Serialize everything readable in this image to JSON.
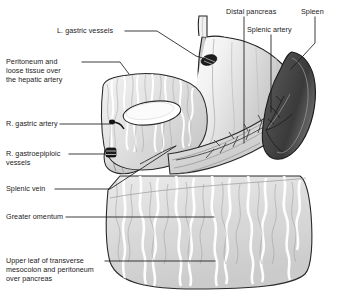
{
  "figure": {
    "background_color": "#ffffff",
    "line_color": "#1a1a1a",
    "tissue_fill": "#d9d9d9",
    "spleen_fill": "#4a4a4a",
    "vessel_fill": "#222222"
  },
  "labels": [
    {
      "id": "l-gastric-vessels",
      "name": "L. gastric vessels",
      "text": "L. gastric vessels",
      "x": 57,
      "y": 28,
      "align": "left"
    },
    {
      "id": "peritoneum-hepatic-artery",
      "name": "Peritoneum and loose tissue over the hepatic artery",
      "text": "Peritoneum and\nloose tissue over\nthe hepatic artery",
      "x": 6,
      "y": 59,
      "align": "left"
    },
    {
      "id": "r-gastric-artery",
      "name": "R. gastric artery",
      "text": "R. gastric artery",
      "x": 6,
      "y": 121,
      "align": "left"
    },
    {
      "id": "r-gastroepiploic-vessels",
      "name": "R. gastroepiploic vessels",
      "text": "R. gastroepiploic\nvessels",
      "x": 6,
      "y": 151,
      "align": "left"
    },
    {
      "id": "splenic-vein",
      "name": "Splenic vein",
      "text": "Splenic vein",
      "x": 6,
      "y": 186,
      "align": "left"
    },
    {
      "id": "greater-omentum",
      "name": "Greater omentum",
      "text": "Greater omentum",
      "x": 6,
      "y": 214,
      "align": "left"
    },
    {
      "id": "upper-leaf-transverse-mesocolon",
      "name": "Upper leaf of transverse mesocolon and peritoneum over pancreas",
      "text": "Upper leaf of transverse\nmesocolon and peritoneum\nover pancreas",
      "x": 6,
      "y": 258,
      "align": "left"
    },
    {
      "id": "distal-pancreas",
      "name": "Distal pancreas",
      "text": "Distal pancreas",
      "x": 226,
      "y": 9,
      "align": "left"
    },
    {
      "id": "spleen",
      "name": "Spleen",
      "text": "Spleen",
      "x": 301,
      "y": 9,
      "align": "left"
    },
    {
      "id": "splenic-artery",
      "name": "Splenic artery",
      "text": "Splenic artery",
      "x": 247,
      "y": 27,
      "align": "left"
    }
  ],
  "leader_lines": [
    {
      "id": "leader-l-gastric-vessels",
      "points": "125,31 157,31 196,56 206,59"
    },
    {
      "id": "leader-peritoneum",
      "points": "82,62 120,62 128,73"
    },
    {
      "id": "leader-r-gastric-artery",
      "points": "60,124 113,124"
    },
    {
      "id": "leader-r-gastroepiploic",
      "points": "69,154 110,154"
    },
    {
      "id": "leader-splenic-vein",
      "points": "55,189 110,189 176,146"
    },
    {
      "id": "leader-greater-omentum",
      "points": "66,217 214,217"
    },
    {
      "id": "leader-upper-leaf",
      "points": "105,261 215,261"
    },
    {
      "id": "leader-distal-pancreas",
      "points": "244,17 244,143"
    },
    {
      "id": "leader-splenic-artery",
      "points": "271,35 271,112"
    },
    {
      "id": "leader-spleen",
      "points": "315,17 315,43 290,68"
    }
  ],
  "organs": [
    {
      "id": "stomach",
      "name": "stomach"
    },
    {
      "id": "spleen-organ",
      "name": "spleen"
    },
    {
      "id": "pancreas",
      "name": "distal pancreas"
    },
    {
      "id": "greater-omentum-organ",
      "name": "greater omentum"
    },
    {
      "id": "lesser-omentum",
      "name": "lesser omentum"
    },
    {
      "id": "duodenum",
      "name": "duodenum"
    },
    {
      "id": "esophagus",
      "name": "esophagus"
    }
  ]
}
